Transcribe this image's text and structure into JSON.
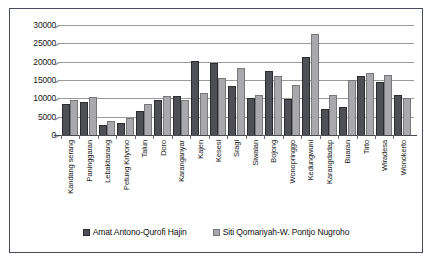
{
  "chart_data": {
    "type": "bar",
    "title": "",
    "subtitle": "",
    "xlabel": "",
    "ylabel": "",
    "ylim": [
      0,
      30000
    ],
    "yticks": [
      0,
      5000,
      10000,
      15000,
      20000,
      25000,
      30000
    ],
    "ytick_labels": [
      "0",
      "5000",
      "10000",
      "15000",
      "20000",
      "25000",
      "30000"
    ],
    "grid": true,
    "legend_position": "bottom",
    "categories": [
      "Kandang serang",
      "Paninggaran",
      "Lebakbarang",
      "Petung Kriyono",
      "Talun",
      "Doro",
      "Karanganyar",
      "Kajen",
      "Kesesi",
      "Sragi",
      "Siwalan",
      "Bojong",
      "Wonopringgo",
      "Kedungwuni",
      "Karangdadap",
      "Buaran",
      "Tirto",
      "Wiradesa",
      "Wonokerto"
    ],
    "series": [
      {
        "name": "Amat Antono-Qurofi Hajin",
        "color": "#4f4f56",
        "values": [
          8200,
          8700,
          2500,
          3000,
          6300,
          9200,
          10400,
          19900,
          19300,
          13200,
          9900,
          17300,
          9500,
          21000,
          6700,
          7300,
          15800,
          14300,
          10700
        ]
      },
      {
        "name": "Siti Qomariyah-W. Pontjo Nugroho",
        "color": "#a9a9ad",
        "values": [
          9200,
          10100,
          3500,
          4400,
          8100,
          10500,
          9300,
          11200,
          15200,
          17900,
          10600,
          15900,
          13300,
          27200,
          10600,
          14600,
          16600,
          16000,
          9900
        ]
      }
    ]
  },
  "legend": {
    "items": [
      {
        "label": "Amat Antono-Qurofi Hajin",
        "swatch": "legend-swatch-series-1"
      },
      {
        "label": "Siti Qomariyah-W. Pontjo Nugroho",
        "swatch": "legend-swatch-series-2"
      }
    ]
  },
  "colors": {
    "series_1": "#4f4f56",
    "series_2": "#a9a9ad",
    "gridline": "#9a9a9a",
    "axis": "#4a4a52",
    "border": "#4a4a5e",
    "background": "#ffffff",
    "text": "#1a1a1a"
  }
}
